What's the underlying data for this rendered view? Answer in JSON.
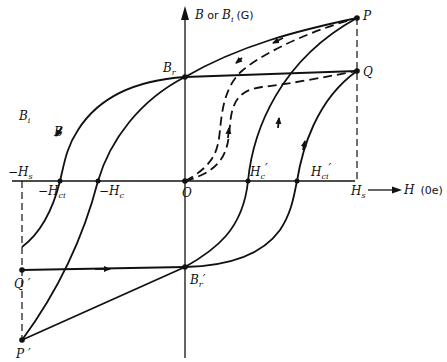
{
  "diagram": {
    "type": "hysteresis-loop",
    "axes": {
      "y_label_main": "B",
      "y_label_or": " or ",
      "y_label_alt": "B",
      "y_label_alt_sub": "i",
      "y_unit": "(G)",
      "x_label": "H",
      "x_unit": "(0e)"
    },
    "points": {
      "P": "P",
      "P_prime": "P ′",
      "Q": "Q",
      "Q_prime": "Q ′",
      "Br": "B",
      "Br_sub": "r",
      "Br_prime": "B",
      "Br_prime_sub": "r",
      "Br_prime_mark": "′",
      "O": "O"
    },
    "curve_labels": {
      "Bi": "B",
      "Bi_sub": "i",
      "B": "B"
    },
    "h_axis_labels": {
      "neg_Hs": "−H",
      "neg_Hs_sub": "s",
      "neg_Hci": "−H",
      "neg_Hci_sub": "ci",
      "neg_Hc": "−H",
      "neg_Hc_sub": "c",
      "Hc_prime": "H",
      "Hc_prime_sub": "c",
      "Hc_prime_mark": "′",
      "Hci_prime": "H",
      "Hci_prime_sub": "ci",
      "Hci_prime_mark": "′",
      "Hs": "H",
      "Hs_sub": "s"
    }
  }
}
